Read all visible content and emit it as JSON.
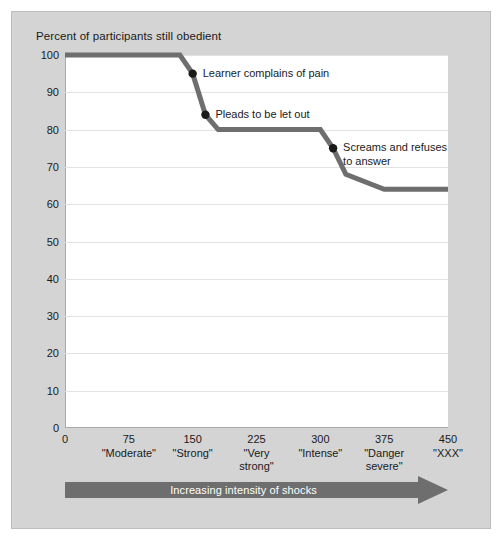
{
  "figure": {
    "background_color": "#d4d4d4",
    "plot_background_color": "#ffffff",
    "series_color": "#6e6e6e",
    "marker_color": "#1a1a1a",
    "gridline_color": "#e2e2e2",
    "arrow_color": "#6e6e6e"
  },
  "chart_data": {
    "type": "line",
    "title": "Percent of participants still obedient",
    "xlabel": "Increasing intensity of shocks",
    "ylabel": "Percent of participants still obedient",
    "xlim": [
      0,
      450
    ],
    "ylim": [
      0,
      100
    ],
    "grid": true,
    "legend": "none",
    "x_ticks": [
      0,
      75,
      150,
      225,
      300,
      375,
      450
    ],
    "x_tick_labels": [
      "0",
      "75",
      "150",
      "225",
      "300",
      "375",
      "450"
    ],
    "x_category_labels": [
      "",
      "\"Moderate\"",
      "\"Strong\"",
      "\"Very\nstrong\"",
      "\"Intense\"",
      "\"Danger\nsevere\"",
      "\"XXX\""
    ],
    "y_ticks": [
      0,
      10,
      20,
      30,
      40,
      50,
      60,
      70,
      80,
      90,
      100
    ],
    "y_tick_labels": [
      "0",
      "10",
      "20",
      "30",
      "40",
      "50",
      "60",
      "70",
      "80",
      "90",
      "100"
    ],
    "series": [
      {
        "name": "Percent still obedient",
        "x": [
          0,
          135,
          150,
          165,
          180,
          300,
          315,
          330,
          375,
          450
        ],
        "values": [
          100,
          100,
          95,
          84,
          80,
          80,
          75,
          68,
          64,
          64
        ]
      }
    ],
    "markers": [
      {
        "x": 150,
        "y": 95,
        "label": "Learner complains of pain"
      },
      {
        "x": 165,
        "y": 84,
        "label": "Pleads to be let out"
      },
      {
        "x": 315,
        "y": 75,
        "label": "Screams and refuses\nto answer"
      }
    ],
    "annotations": [
      {
        "text": "Learner complains of pain",
        "x": 150,
        "y": 95
      },
      {
        "text": "Pleads to be let out",
        "x": 165,
        "y": 84
      },
      {
        "text": "Screams and refuses\nto answer",
        "x": 315,
        "y": 75
      }
    ]
  },
  "arrow": {
    "label": "Increasing intensity of shocks",
    "direction": "right"
  }
}
